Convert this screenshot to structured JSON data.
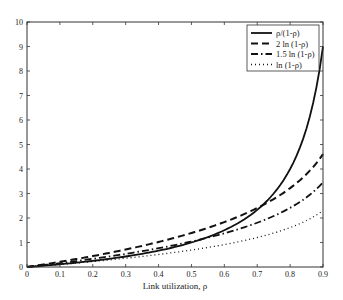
{
  "chart_data": {
    "type": "line",
    "title": "",
    "xlabel": "Link utilization, ρ",
    "ylabel": "",
    "xlim": [
      0,
      0.9
    ],
    "ylim": [
      0,
      10
    ],
    "grid": false,
    "legend_position": "upper right",
    "x_ticks": [
      "0",
      "0.1",
      "0.2",
      "0.3",
      "0.4",
      "0.5",
      "0.6",
      "0.7",
      "0.8",
      "0.9"
    ],
    "y_ticks": [
      "0",
      "1",
      "2",
      "3",
      "4",
      "5",
      "6",
      "7",
      "8",
      "9",
      "10"
    ],
    "x": [
      0,
      0.1,
      0.2,
      0.3,
      0.4,
      0.5,
      0.6,
      0.7,
      0.8,
      0.9
    ],
    "series": [
      {
        "name": "ρ/(1-ρ)",
        "style": "solid",
        "values": [
          0,
          0.111,
          0.25,
          0.429,
          0.667,
          1.0,
          1.5,
          2.333,
          4.0,
          9.0
        ]
      },
      {
        "name": "2 ln (1-ρ)",
        "style": "dashed",
        "values": [
          0,
          0.211,
          0.446,
          0.713,
          1.022,
          1.386,
          1.833,
          2.408,
          3.219,
          4.605
        ]
      },
      {
        "name": "1.5 ln (1-ρ)",
        "style": "dash-dot",
        "values": [
          0,
          0.158,
          0.335,
          0.535,
          0.766,
          1.04,
          1.374,
          1.806,
          2.414,
          3.454
        ]
      },
      {
        "name": "ln (1-ρ)",
        "style": "dotted",
        "values": [
          0,
          0.105,
          0.223,
          0.357,
          0.511,
          0.693,
          0.916,
          1.204,
          1.609,
          2.303
        ]
      }
    ]
  }
}
